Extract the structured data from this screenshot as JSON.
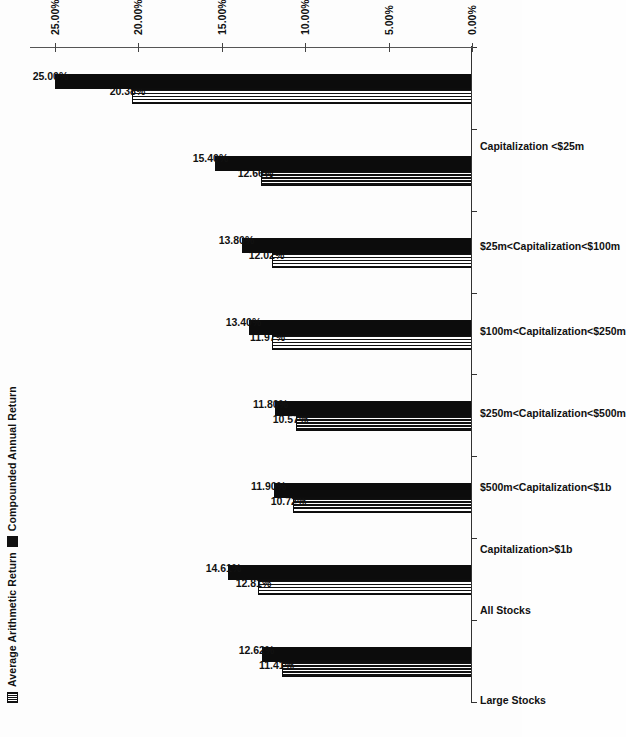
{
  "chart_data": {
    "type": "bar",
    "title": "",
    "xlabel": "",
    "ylabel": "",
    "ylim": [
      0,
      26.5
    ],
    "grid": false,
    "legend_position": "top-left",
    "orientation": "rotated-90-vertical-bars",
    "categories": [
      "Large Stocks",
      "All Stocks",
      "Capitalization>$1b",
      "$500m<Capitalization<$1b",
      "$250m<Capitalization<$500m",
      "$100m<Capitalization<$250m",
      "$25m<Capitalization<$100m",
      "Capitalization <$25m"
    ],
    "series": [
      {
        "name": "Average Arithmetic Return",
        "fill": "vertical-hatch",
        "values": [
          11.41,
          12.81,
          10.72,
          10.57,
          11.97,
          12.02,
          12.66,
          20.38
        ],
        "labels": [
          "11.41%",
          "12.81%",
          "10.72%",
          "10.57%",
          "11.97%",
          "12.02%",
          "12.66%",
          "20.38%"
        ]
      },
      {
        "name": "Compounded Annual Return",
        "fill": "solid-black",
        "values": [
          12.62,
          14.61,
          11.9,
          11.8,
          13.4,
          13.8,
          15.4,
          25.0
        ],
        "labels": [
          "12.62%",
          "14.61%",
          "11.90%",
          "11.80%",
          "13.40%",
          "13.80%",
          "15.40%",
          "25.00%"
        ]
      }
    ],
    "axis_ticks": [
      {
        "value": 0,
        "label": "0.00%"
      },
      {
        "value": 5,
        "label": "5.00%"
      },
      {
        "value": 10,
        "label": "10.00%"
      },
      {
        "value": 15,
        "label": "15.00%"
      },
      {
        "value": 20,
        "label": "20.00%"
      },
      {
        "value": 25,
        "label": "25.00%"
      }
    ]
  },
  "legend": {
    "items": [
      {
        "label": "Average Arithmetic Return",
        "swatch": "hatch"
      },
      {
        "label": "Compounded Annual Return",
        "swatch": "solid"
      }
    ]
  },
  "colors": {
    "series_1": "#111111",
    "series_2": "#0c0c0c",
    "axis": "#333333",
    "background": "#fdfdfd"
  }
}
